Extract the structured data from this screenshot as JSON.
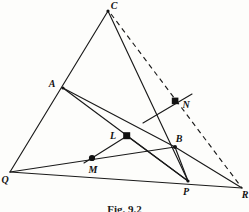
{
  "figure": {
    "caption": "Fig. 9.2",
    "stroke_color": "#1a1a1a",
    "background_color": "#fdfdfb",
    "points": [
      {
        "id": "C",
        "label": "C",
        "x": 108,
        "y": 11,
        "label_x": 114,
        "label_y": 8,
        "marker": "vertex"
      },
      {
        "id": "A",
        "label": "A",
        "x": 63,
        "y": 88,
        "label_x": 52,
        "label_y": 87,
        "marker": "vertex"
      },
      {
        "id": "Q",
        "label": "Q",
        "x": 10,
        "y": 172,
        "label_x": 3,
        "label_y": 182,
        "marker": "vertex"
      },
      {
        "id": "R",
        "label": "R",
        "x": 242,
        "y": 188,
        "label_x": 243,
        "label_y": 196,
        "marker": "vertex"
      },
      {
        "id": "P",
        "label": "P",
        "x": 188,
        "y": 181,
        "label_x": 184,
        "label_y": 194,
        "marker": "vertex"
      },
      {
        "id": "B",
        "label": "B",
        "x": 175,
        "y": 147,
        "label_x": 176,
        "label_y": 142,
        "marker": "vertex"
      },
      {
        "id": "L",
        "label": "L",
        "x": 127,
        "y": 136,
        "label_x": 112,
        "label_y": 138,
        "marker": "dot"
      },
      {
        "id": "M",
        "label": "M",
        "x": 92,
        "y": 158,
        "label_x": 90,
        "label_y": 172,
        "marker": "dot"
      },
      {
        "id": "N",
        "label": "N",
        "x": 175,
        "y": 101,
        "label_x": 183,
        "label_y": 107,
        "marker": "dot"
      }
    ],
    "solid_segments": [
      {
        "name": "edge-C-Q",
        "from": "C",
        "to": "Q"
      },
      {
        "name": "edge-Q-R",
        "from": "Q",
        "to": "R"
      },
      {
        "name": "cevian-C-P",
        "from": "C",
        "to": "P"
      },
      {
        "name": "cevian-A-P",
        "from": "A",
        "to": "P"
      },
      {
        "name": "segment-A-B",
        "from": "A",
        "to": "B"
      },
      {
        "name": "segment-Q-B",
        "from": "Q",
        "to": "B"
      },
      {
        "name": "segment-B-R",
        "from": "B",
        "to": "R"
      },
      {
        "name": "segment-B-P",
        "from": "B",
        "to": "P"
      },
      {
        "name": "segment-L-M",
        "from": "L",
        "to": "M"
      },
      {
        "name": "segment-L-P",
        "from": "L",
        "to": "P"
      }
    ],
    "short_solid_segment": {
      "name": "segment-through-N",
      "x1": 143,
      "y1": 123,
      "x2": 192,
      "y2": 94
    },
    "dashed_segments": [
      {
        "name": "dashed-C-R",
        "from": "C",
        "to": "R"
      }
    ]
  }
}
